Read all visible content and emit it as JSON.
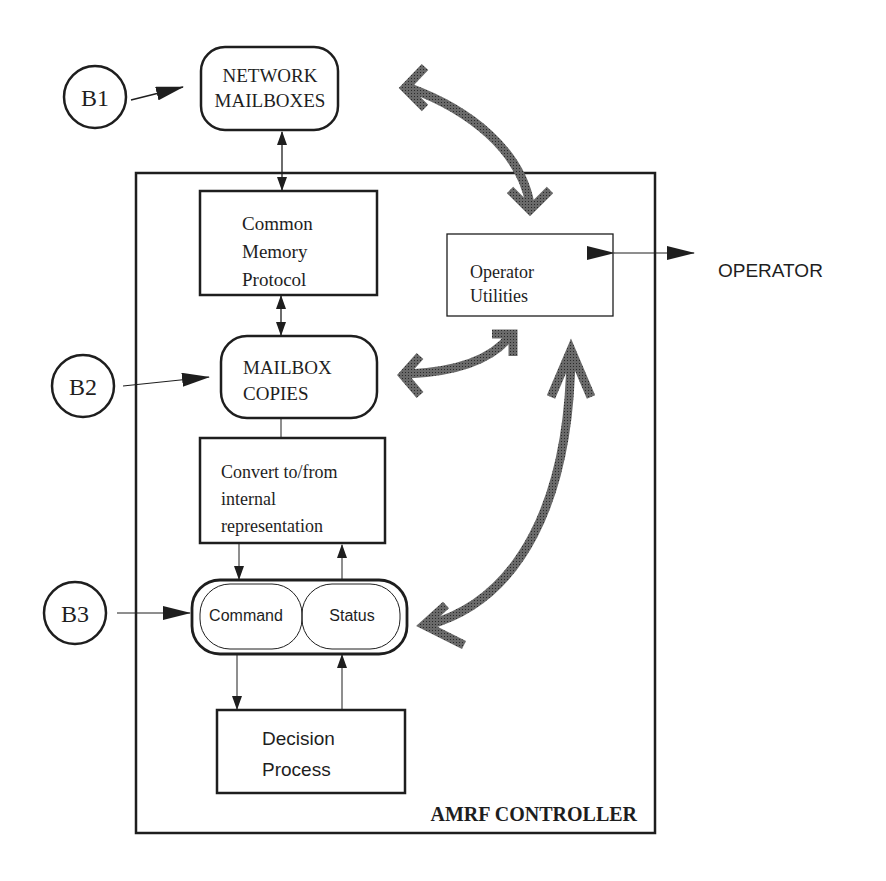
{
  "diagram": {
    "title": "AMRF CONTROLLER",
    "external_inputs": [
      {
        "id": "B1",
        "label": "B1"
      },
      {
        "id": "B2",
        "label": "B2"
      },
      {
        "id": "B3",
        "label": "B3"
      }
    ],
    "nodes": {
      "network_mailboxes": {
        "lines": [
          "NETWORK",
          "MAILBOXES"
        ]
      },
      "common_memory_protocol": {
        "lines": [
          "Common",
          "Memory",
          "Protocol"
        ]
      },
      "operator_utilities": {
        "lines": [
          "Operator",
          "Utilities"
        ]
      },
      "operator": {
        "label": "OPERATOR"
      },
      "mailbox_copies": {
        "lines": [
          "MAILBOX",
          "COPIES"
        ]
      },
      "convert": {
        "lines": [
          "Convert to/from",
          "internal",
          "representation"
        ]
      },
      "command": {
        "label": "Command"
      },
      "status": {
        "label": "Status"
      },
      "decision_process": {
        "lines": [
          "Decision",
          "Process"
        ]
      }
    },
    "edges": [
      {
        "from": "B1",
        "to": "network_mailboxes",
        "type": "arrow"
      },
      {
        "from": "network_mailboxes",
        "to": "common_memory_protocol",
        "type": "bidirectional"
      },
      {
        "from": "common_memory_protocol",
        "to": "mailbox_copies",
        "type": "bidirectional"
      },
      {
        "from": "B2",
        "to": "mailbox_copies",
        "type": "arrow"
      },
      {
        "from": "mailbox_copies",
        "to": "convert",
        "type": "line"
      },
      {
        "from": "convert",
        "to": "command",
        "type": "arrow"
      },
      {
        "from": "status",
        "to": "convert",
        "type": "arrow"
      },
      {
        "from": "B3",
        "to": "command",
        "type": "arrow"
      },
      {
        "from": "command",
        "to": "decision_process",
        "type": "arrow"
      },
      {
        "from": "decision_process",
        "to": "status",
        "type": "arrow"
      },
      {
        "from": "operator_utilities",
        "to": "operator",
        "type": "bidirectional"
      },
      {
        "from": "network_mailboxes",
        "to": "operator_utilities",
        "type": "thick-bidirectional"
      },
      {
        "from": "mailbox_copies",
        "to": "operator_utilities",
        "type": "thick-bidirectional"
      },
      {
        "from": "command_status",
        "to": "operator_utilities",
        "type": "thick-bidirectional"
      }
    ],
    "colors": {
      "line": "#1e1e1e",
      "thick_arrow": "#4a4a4a",
      "background": "#ffffff"
    }
  }
}
